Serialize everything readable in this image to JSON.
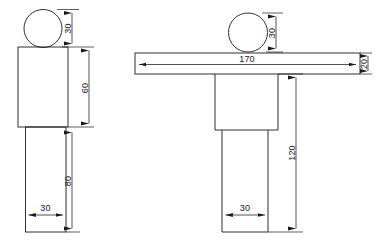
{
  "drawing": {
    "title": "Two-view dimensioned outline drawing",
    "background_color": "#ffffff",
    "line_color": "#1a1a1a",
    "units": "mm",
    "figures": [
      {
        "name": "left-figure",
        "description": "Circle over rectangle over narrower rectangle (I-shaped column with round head)",
        "shapes": [
          {
            "name": "head-circle",
            "type": "circle"
          },
          {
            "name": "body-rectangle",
            "type": "rect"
          },
          {
            "name": "leg-rectangle",
            "type": "rect"
          }
        ],
        "dimensions": [
          {
            "name": "left-head-height",
            "value": "30",
            "orientation": "vertical"
          },
          {
            "name": "left-body-height",
            "value": "60",
            "orientation": "vertical"
          },
          {
            "name": "left-leg-height",
            "value": "80",
            "orientation": "vertical"
          },
          {
            "name": "left-leg-width",
            "value": "30",
            "orientation": "horizontal"
          }
        ]
      },
      {
        "name": "right-figure",
        "description": "Circle over wide horizontal bar over stem (T-shaped section with round head)",
        "shapes": [
          {
            "name": "head-circle",
            "type": "circle"
          },
          {
            "name": "flange-bar",
            "type": "rect"
          },
          {
            "name": "stem-upper",
            "type": "rect"
          },
          {
            "name": "stem-lower",
            "type": "rect"
          }
        ],
        "dimensions": [
          {
            "name": "right-head-height",
            "value": "30",
            "orientation": "vertical"
          },
          {
            "name": "right-flange-width",
            "value": "170",
            "orientation": "horizontal"
          },
          {
            "name": "right-flange-thickness",
            "value": "20",
            "orientation": "vertical"
          },
          {
            "name": "right-stem-height",
            "value": "120",
            "orientation": "vertical"
          },
          {
            "name": "right-stem-width",
            "value": "30",
            "orientation": "horizontal"
          }
        ]
      }
    ],
    "labels": {
      "left_head_30": "30",
      "left_body_60": "60",
      "left_leg_80": "80",
      "left_leg_width_30": "30",
      "right_head_30": "30",
      "right_flange_170": "170",
      "right_flange_20": "20",
      "right_stem_120": "120",
      "right_stem_width_30": "30"
    }
  }
}
